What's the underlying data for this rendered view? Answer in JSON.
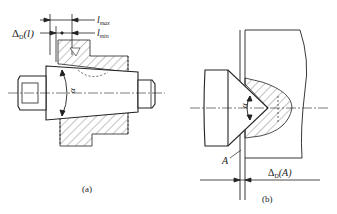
{
  "figure_a": {
    "caption": "(a)",
    "label_delta": "Δ",
    "label_delta_sub": "D",
    "label_delta_arg": "(l)",
    "label_lmax": "l",
    "label_lmax_sub": "max",
    "label_lmin": "l",
    "label_lmin_sub": "min",
    "label_alpha": "α"
  },
  "figure_b": {
    "caption": "(b)",
    "label_A": "A",
    "label_delta": "Δ",
    "label_delta_sub": "D",
    "label_delta_arg": "(A)",
    "label_alpha": "α"
  },
  "colors": {
    "line": "#222222",
    "hatch": "#555555",
    "background": "#ffffff"
  }
}
